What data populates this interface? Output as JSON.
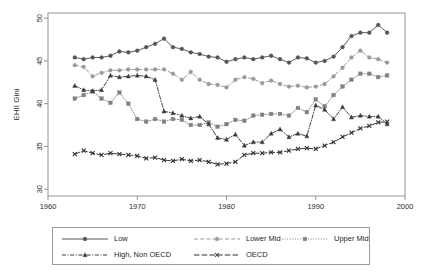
{
  "figure": {
    "background": "#ffffff"
  },
  "chart_data": {
    "type": "line",
    "title": "",
    "xlabel": "year",
    "ylabel": "EHII Gini",
    "xlim": [
      1960,
      2000
    ],
    "ylim": [
      29.2,
      50.6
    ],
    "xticks": [
      1960,
      1970,
      1980,
      1990,
      2000
    ],
    "yticks": [
      30,
      35,
      40,
      45,
      50
    ],
    "grid": false,
    "legend_position": "below",
    "x": [
      1963,
      1964,
      1965,
      1966,
      1967,
      1968,
      1969,
      1970,
      1971,
      1972,
      1973,
      1974,
      1975,
      1976,
      1977,
      1978,
      1979,
      1980,
      1981,
      1982,
      1983,
      1984,
      1985,
      1986,
      1987,
      1988,
      1989,
      1990,
      1991,
      1992,
      1993,
      1994,
      1995,
      1996,
      1997,
      1998
    ],
    "series": [
      {
        "name": "Low",
        "color": "#555555",
        "marker": "circle",
        "dash": "solid",
        "values": [
          45.4,
          45.2,
          45.4,
          45.4,
          45.6,
          46.1,
          46.0,
          46.2,
          46.6,
          47.0,
          47.6,
          46.6,
          46.4,
          46.0,
          45.8,
          45.5,
          45.4,
          44.9,
          45.2,
          45.4,
          45.2,
          45.4,
          45.6,
          45.2,
          44.8,
          45.4,
          45.3,
          44.8,
          45.0,
          45.5,
          46.6,
          47.9,
          48.3,
          48.3,
          49.2,
          48.3
        ]
      },
      {
        "name": "Lower Mid",
        "color": "#9a9a9a",
        "marker": "circle",
        "dash": "dashed",
        "values": [
          44.5,
          44.3,
          43.2,
          43.6,
          43.9,
          43.9,
          44.0,
          44.0,
          44.0,
          44.0,
          44.0,
          43.5,
          42.8,
          43.7,
          42.8,
          42.3,
          42.2,
          41.9,
          42.8,
          43.1,
          42.9,
          42.4,
          42.7,
          42.3,
          42.0,
          42.1,
          41.9,
          42.0,
          42.3,
          43.2,
          44.2,
          45.4,
          46.2,
          45.4,
          45.2,
          44.8
        ]
      },
      {
        "name": "Upper Mid",
        "color": "#808080",
        "marker": "square",
        "dash": "dotted",
        "values": [
          40.6,
          41.0,
          41.4,
          40.6,
          40.1,
          41.3,
          40.0,
          38.2,
          37.9,
          38.2,
          37.9,
          38.2,
          38.1,
          37.5,
          37.5,
          37.8,
          37.3,
          37.6,
          38.1,
          38.0,
          38.6,
          38.7,
          38.8,
          38.8,
          38.6,
          39.5,
          39.0,
          40.5,
          39.7,
          41.0,
          42.0,
          42.8,
          43.5,
          43.5,
          43.1,
          43.3
        ]
      },
      {
        "name": "High, Non OECD",
        "color": "#3b3b3b",
        "marker": "triangle",
        "dash": "dashdot",
        "values": [
          42.1,
          41.6,
          41.5,
          41.6,
          43.3,
          43.1,
          43.2,
          43.3,
          43.2,
          42.8,
          39.1,
          38.9,
          38.6,
          38.3,
          38.5,
          37.6,
          36.0,
          35.8,
          36.4,
          35.1,
          35.5,
          35.5,
          36.5,
          37.0,
          36.1,
          36.5,
          36.2,
          39.8,
          39.3,
          38.2,
          39.6,
          38.4,
          38.6,
          38.5,
          38.5,
          37.6
        ]
      },
      {
        "name": "OECD",
        "color": "#2e2e2e",
        "marker": "x",
        "dash": "longdash",
        "values": [
          34.1,
          34.5,
          34.2,
          34.0,
          34.2,
          34.1,
          34.0,
          33.9,
          33.6,
          33.7,
          33.4,
          33.3,
          33.5,
          33.3,
          33.4,
          33.2,
          32.9,
          33.0,
          33.2,
          34.0,
          34.2,
          34.2,
          34.3,
          34.3,
          34.5,
          34.7,
          34.8,
          34.7,
          35.1,
          35.5,
          36.1,
          36.6,
          37.1,
          37.4,
          37.8,
          37.9
        ]
      }
    ]
  },
  "legend": {
    "items": [
      {
        "label": "Low",
        "sample": "solid-circle"
      },
      {
        "label": "Lower Mid",
        "sample": "dashed-circle"
      },
      {
        "label": "Upper Mid",
        "sample": "dotted-square"
      },
      {
        "label": "High, Non OECD",
        "sample": "dashdot-triangle"
      },
      {
        "label": "OECD",
        "sample": "longdash-x"
      }
    ]
  }
}
